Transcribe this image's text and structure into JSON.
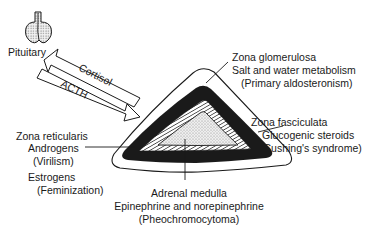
{
  "pituitary": {
    "label": "Pituitary"
  },
  "arrows": {
    "cortisol": {
      "label": "Cortisol",
      "direction": "toward-pituitary"
    },
    "acth": {
      "label": "ACTH",
      "direction": "toward-adrenal"
    }
  },
  "zones": {
    "glomerulosa": {
      "name": "Zona glomerulosa",
      "function": "Salt and water metabolism",
      "disorder": "(Primary aldosteronism)"
    },
    "fasciculata": {
      "name": "Zona fasciculata",
      "function": "Glucogenic steroids",
      "disorder": "(Cushing's syndrome)"
    },
    "reticularis": {
      "name": "Zona reticularis",
      "function1": "Androgens",
      "disorder1": "(Virilism)",
      "function2": "Estrogens",
      "disorder2": "(Feminization)"
    },
    "medulla": {
      "name": "Adrenal medulla",
      "function": "Epinephrine and norepinephrine",
      "disorder": "(Pheochromocytoma)"
    }
  },
  "colors": {
    "ink": "#1a1a1a",
    "background": "#ffffff",
    "stipple": "#cfcfcf"
  }
}
